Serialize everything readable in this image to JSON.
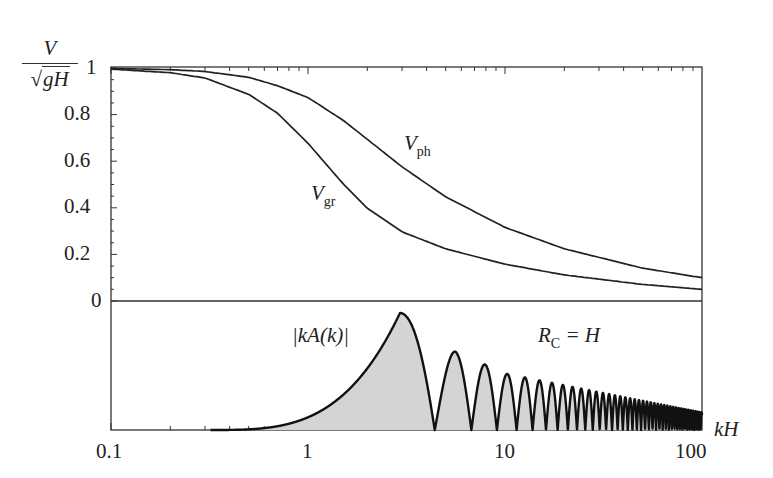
{
  "chart_data": {
    "type": "line",
    "title": "",
    "x_scale": "log",
    "xlabel": "kH",
    "xlim": [
      0.1,
      100
    ],
    "x_ticks": [
      "0.1",
      "1",
      "10",
      "100"
    ],
    "upper_panel": {
      "ylabel_numerator": "V",
      "ylabel_denominator_radical": "√",
      "ylabel_denominator_body": "gH",
      "ylim": [
        0,
        1
      ],
      "y_ticks": [
        "0",
        "0.2",
        "0.4",
        "0.6",
        "0.8",
        "1"
      ],
      "x": [
        0.1,
        0.2,
        0.3,
        0.5,
        0.7,
        1.0,
        1.5,
        2,
        3,
        5,
        10,
        20,
        50,
        100
      ],
      "series": [
        {
          "name": "V_ph",
          "label_main": "V",
          "label_sub": "ph",
          "values": [
            0.998,
            0.993,
            0.985,
            0.96,
            0.924,
            0.873,
            0.777,
            0.694,
            0.576,
            0.447,
            0.316,
            0.224,
            0.141,
            0.1
          ]
        },
        {
          "name": "V_gr",
          "label_main": "V",
          "label_sub": "gr",
          "values": [
            0.995,
            0.98,
            0.957,
            0.887,
            0.806,
            0.677,
            0.505,
            0.398,
            0.297,
            0.224,
            0.158,
            0.112,
            0.071,
            0.05
          ]
        }
      ]
    },
    "lower_panel": {
      "type": "area",
      "series_label": "|kA(k)|",
      "annotation_main": "R",
      "annotation_sub": "C",
      "annotation_rest": " = H",
      "fill_color": "#d4d4d4",
      "line_color": "#111111",
      "start_kH": 0.32,
      "main_peak_kH": 2.93,
      "main_peak_rel": 1.0,
      "first_zero_kH": 4.4,
      "zero_spacing_kH": 2.35,
      "hump_peaks": [
        {
          "kH": 5.6,
          "rel": 0.67
        },
        {
          "kH": 7.9,
          "rel": 0.56
        },
        {
          "kH": 10.2,
          "rel": 0.48
        },
        {
          "kH": 100,
          "rel": 0.15
        }
      ]
    }
  }
}
